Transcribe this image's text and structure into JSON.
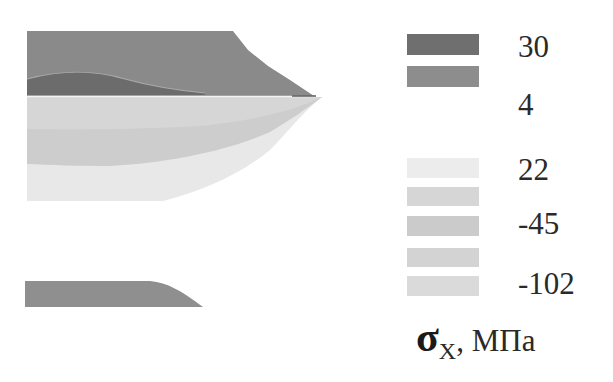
{
  "figure": {
    "type": "stress-contour-map",
    "quantity_symbol": "σ",
    "quantity_subscript": "X",
    "unit_label": ", МПа",
    "legend": [
      {
        "color": "#6f6f6f",
        "label": "30"
      },
      {
        "color": "#8d8d8d",
        "label": ""
      },
      {
        "color": "#ffffff",
        "label": "4"
      },
      {
        "color": "#ebebeb",
        "label": "22"
      },
      {
        "color": "#d0d0d0",
        "label": ""
      },
      {
        "color": "#c8c8c8",
        "label": "-45"
      },
      {
        "color": "#d2d2d2",
        "label": ""
      },
      {
        "color": "#dadada",
        "label": "-102"
      }
    ],
    "labels": {
      "l1": "30",
      "l2": "4",
      "l3": "22",
      "l4": "-45",
      "l5": "-102"
    },
    "colors": {
      "upper_region": "#8a8a8a",
      "dark_lens": "#6c6c6c",
      "mid_band": "#cdcdcd",
      "light_band": "#e7e7e7",
      "bottom_shape": "#8f8f8f",
      "interface_line": "#f4f4f4"
    }
  }
}
